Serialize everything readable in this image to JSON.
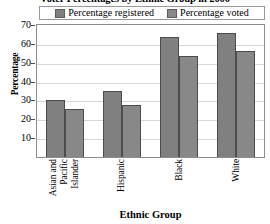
{
  "chart_data": {
    "type": "bar",
    "title": "Voter Percentages by Ethnic Group in 2000",
    "xlabel": "Ethnic Group",
    "ylabel": "Percentage",
    "ylim": [
      0,
      70
    ],
    "yticks": [
      10,
      20,
      30,
      40,
      50,
      60,
      70
    ],
    "grid": true,
    "legend_position": "top",
    "categories": [
      "Asian and Pacific Islander",
      "Hispanic",
      "Black",
      "White"
    ],
    "category_lines": [
      [
        "Asian and",
        "Pacific",
        "Islander"
      ],
      [
        "Hispanic"
      ],
      [
        "Black"
      ],
      [
        "White"
      ]
    ],
    "series": [
      {
        "name": "Percentage registered",
        "color": "#808080",
        "values": [
          30.0,
          34.9,
          63.6,
          65.6
        ]
      },
      {
        "name": "Percentage voted",
        "color": "#888888",
        "values": [
          25.5,
          27.5,
          53.5,
          56.0
        ]
      }
    ]
  },
  "legend": {
    "entries": [
      {
        "label": "Percentage registered"
      },
      {
        "label": "Percentage voted"
      }
    ]
  },
  "axes": {
    "y_title": "Percentage",
    "x_title": "Ethnic Group",
    "y_tick_labels": [
      "70",
      "60",
      "50",
      "40",
      "30",
      "20",
      "10"
    ]
  }
}
